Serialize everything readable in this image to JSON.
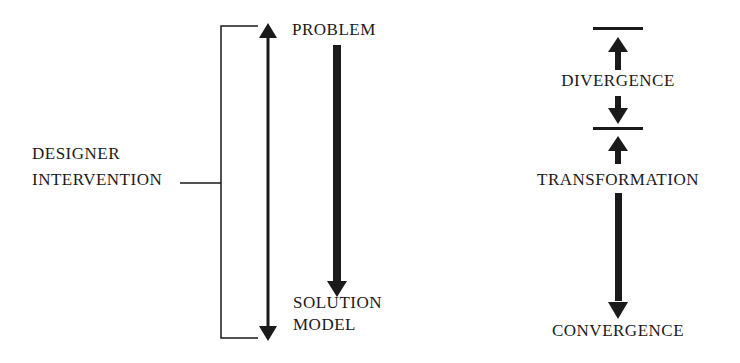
{
  "diagram": {
    "left": {
      "bracket_label_line1": "DESIGNER",
      "bracket_label_line2": "INTERVENTION",
      "top_label": "PROBLEM",
      "bottom_label_line1": "SOLUTION",
      "bottom_label_line2": "MODEL"
    },
    "right": {
      "stage1": "DIVERGENCE",
      "stage2": "TRANSFORMATION",
      "stage3": "CONVERGENCE"
    },
    "colors": {
      "ink": "#1a1a1a",
      "background": "#ffffff"
    }
  }
}
